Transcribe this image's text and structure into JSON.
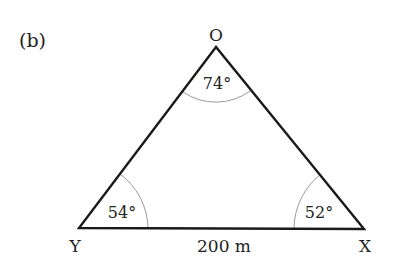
{
  "figure": {
    "part_label": "(b)"
  },
  "triangle": {
    "vertices": {
      "top": "O",
      "left": "Y",
      "right": "X"
    },
    "angles": {
      "O": "74°",
      "Y": "54°",
      "X": "52°"
    },
    "sides": {
      "YX": "200 m"
    }
  },
  "colors": {
    "edge": "#1a1a1a",
    "arc": "#9a9a9a",
    "text": "#222222"
  }
}
